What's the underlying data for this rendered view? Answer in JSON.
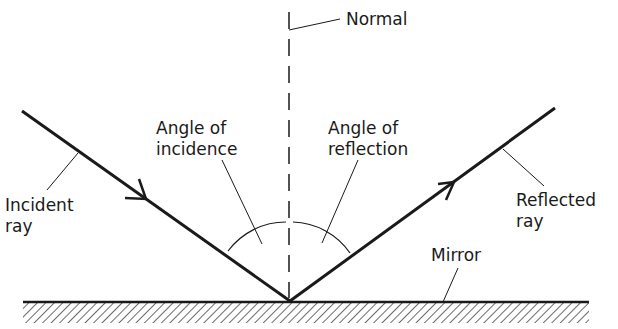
{
  "figure": {
    "colors": {
      "ink": "#1a1a1a",
      "background": "#ffffff"
    },
    "labels": {
      "normal": "Normal",
      "incident_ray": [
        "Incident",
        "ray"
      ],
      "reflected_ray": [
        "Reflected",
        "ray"
      ],
      "angle_of_incidence": [
        "Angle of",
        "incidence"
      ],
      "angle_of_reflection": [
        "Angle of",
        "reflection"
      ],
      "mirror": "Mirror"
    }
  }
}
